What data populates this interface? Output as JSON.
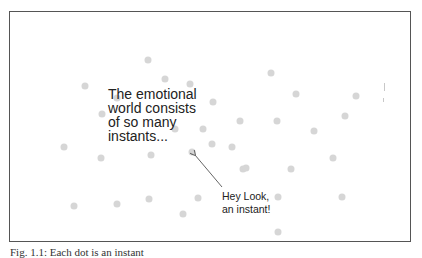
{
  "figure": {
    "main_text": {
      "lines": [
        "The emotional",
        "world consists",
        "of so many",
        "instants..."
      ]
    },
    "callout": {
      "lines": [
        "Hey Look,",
        "an instant!"
      ],
      "target_dot": [
        192,
        152
      ]
    },
    "caption": "Fig. 1.1: Each dot is an instant",
    "colors": {
      "frame": "#555555",
      "dot": "#d6d6d6",
      "text": "#222222",
      "arrow": "#666666"
    },
    "dots": [
      [
        148,
        60
      ],
      [
        165,
        79
      ],
      [
        190,
        84
      ],
      [
        85,
        86
      ],
      [
        271,
        73
      ],
      [
        296,
        94
      ],
      [
        356,
        96
      ],
      [
        213,
        102
      ],
      [
        117,
        98
      ],
      [
        345,
        116
      ],
      [
        102,
        114
      ],
      [
        203,
        129
      ],
      [
        240,
        121
      ],
      [
        277,
        121
      ],
      [
        314,
        131
      ],
      [
        175,
        129
      ],
      [
        212,
        144
      ],
      [
        64,
        147
      ],
      [
        232,
        147
      ],
      [
        101,
        158
      ],
      [
        151,
        155
      ],
      [
        192,
        152
      ],
      [
        243,
        169
      ],
      [
        333,
        158
      ],
      [
        291,
        169
      ],
      [
        74,
        206
      ],
      [
        117,
        204
      ],
      [
        149,
        199
      ],
      [
        183,
        214
      ],
      [
        198,
        198
      ],
      [
        278,
        197
      ],
      [
        342,
        197
      ],
      [
        278,
        232
      ],
      [
        246,
        168
      ]
    ]
  }
}
